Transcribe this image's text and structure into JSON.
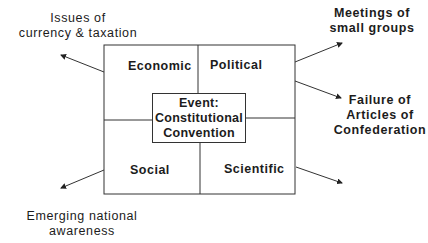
{
  "diagram": {
    "quadrants": {
      "top_left": "Economic",
      "top_right": "Political",
      "bottom_left": "Social",
      "bottom_right": "Scientific"
    },
    "center": {
      "line1": "Event:",
      "line2": "Constitutional",
      "line3": "Convention"
    },
    "outcomes": {
      "top_left": {
        "line1": "Issues of",
        "line2": "currency & taxation"
      },
      "top_right": {
        "line1": "Meetings of",
        "line2": "small groups"
      },
      "mid_right": {
        "line1": "Failure of",
        "line2": "Articles of",
        "line3": "Confederation"
      },
      "bottom_left": {
        "line1": "Emerging national",
        "line2": "awareness"
      }
    }
  }
}
